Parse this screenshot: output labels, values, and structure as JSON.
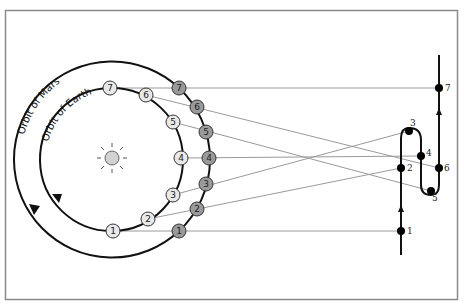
{
  "diagram": {
    "labels": {
      "mars_orbit": "Orbit of Mars",
      "earth_orbit": "Orbit of Earth"
    },
    "colors": {
      "frame": "#8a8a8a",
      "orbit": "#111111",
      "earth_fill": "#e8e8e8",
      "mars_fill": "#9a9a9a",
      "sun_fill": "#d2d2d2",
      "sightline": "#9a9a9a",
      "path": "#111111"
    },
    "earth_positions": [
      {
        "n": "1",
        "x": 113,
        "y": 231
      },
      {
        "n": "2",
        "x": 148,
        "y": 219
      },
      {
        "n": "3",
        "x": 173,
        "y": 195
      },
      {
        "n": "4",
        "x": 181,
        "y": 158
      },
      {
        "n": "5",
        "x": 173,
        "y": 122
      },
      {
        "n": "6",
        "x": 146,
        "y": 95
      },
      {
        "n": "7",
        "x": 110,
        "y": 88
      }
    ],
    "mars_positions": [
      {
        "n": "1",
        "x": 179,
        "y": 231
      },
      {
        "n": "2",
        "x": 197,
        "y": 209
      },
      {
        "n": "3",
        "x": 206,
        "y": 184
      },
      {
        "n": "4",
        "x": 209,
        "y": 158
      },
      {
        "n": "5",
        "x": 206,
        "y": 132
      },
      {
        "n": "6",
        "x": 197,
        "y": 107
      },
      {
        "n": "7",
        "x": 179,
        "y": 88
      }
    ],
    "apparent_positions": [
      {
        "n": "1",
        "x": 401,
        "y": 231
      },
      {
        "n": "2",
        "x": 401,
        "y": 168
      },
      {
        "n": "3",
        "x": 409,
        "y": 131
      },
      {
        "n": "4",
        "x": 421,
        "y": 156
      },
      {
        "n": "5",
        "x": 431,
        "y": 191
      },
      {
        "n": "6",
        "x": 439,
        "y": 168
      },
      {
        "n": "7",
        "x": 439,
        "y": 88
      }
    ]
  }
}
